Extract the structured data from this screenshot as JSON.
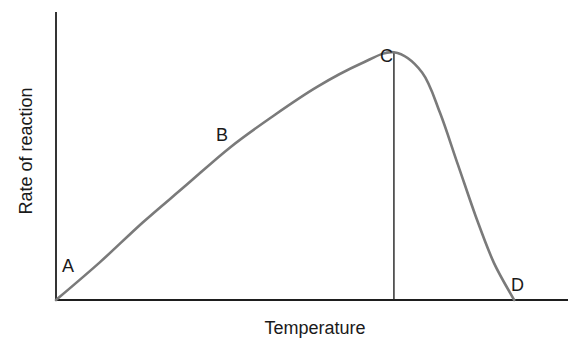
{
  "chart_data": {
    "type": "line",
    "title": "",
    "xlabel": "Temperature",
    "ylabel": "Rate of reaction",
    "grid": false,
    "legend": null,
    "x_ticks": [],
    "y_ticks": [],
    "xlim": [
      0,
      100
    ],
    "ylim": [
      0,
      100
    ],
    "series": [
      {
        "name": "Rate of reaction vs Temperature",
        "color": "#7a7a7a",
        "x": [
          0,
          8.5,
          17,
          25.5,
          34,
          42.5,
          51,
          59.5,
          66,
          71.5,
          75,
          78.5,
          82,
          85.5,
          89.5
        ],
        "y": [
          0,
          13,
          27,
          40,
          53,
          64,
          74,
          82,
          86,
          79,
          65,
          47,
          29,
          13,
          0
        ]
      }
    ],
    "annotations": [
      {
        "label": "A",
        "x": 0,
        "y": 0,
        "note": "origin, start of curve"
      },
      {
        "label": "B",
        "x": 32,
        "y": 53,
        "note": "rising section"
      },
      {
        "label": "C",
        "x": 66,
        "y": 86,
        "note": "peak / optimum temperature"
      },
      {
        "label": "D",
        "x": 89.5,
        "y": 0,
        "note": "rate falls to zero"
      }
    ],
    "reference_lines": [
      {
        "orientation": "vertical",
        "x": 66,
        "from_y": 0,
        "to_y": 86,
        "note": "drop line from peak C"
      }
    ]
  },
  "labels": {
    "point_a": "A",
    "point_b": "B",
    "point_c": "C",
    "point_d": "D",
    "x_axis_title": "Temperature",
    "y_axis_title": "Rate of reaction"
  }
}
